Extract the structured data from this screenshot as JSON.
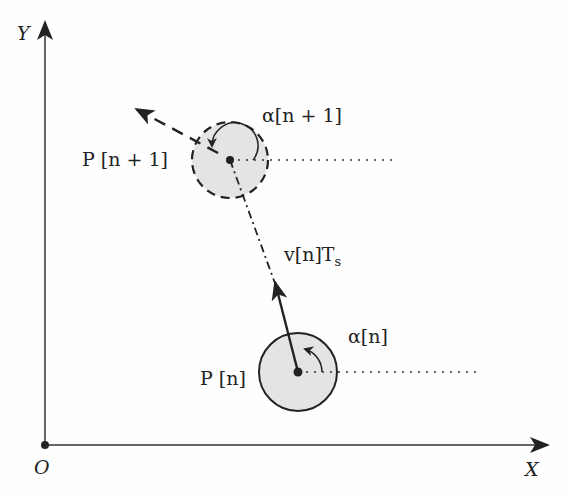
{
  "diagram": {
    "type": "kinematic-motion-model",
    "axes": {
      "x_label": "X",
      "y_label": "Y",
      "origin_label": "O"
    },
    "positions": {
      "current": {
        "label": "P [n]",
        "angle_label": "α[n]",
        "outline": "solid"
      },
      "next": {
        "label": "P [n + 1]",
        "angle_label": "α[n + 1]",
        "outline": "dashed"
      }
    },
    "displacement_label": "v[n]T",
    "displacement_subscript": "s",
    "colors": {
      "stroke": "#222222",
      "fill": "#e4e4e4",
      "background": "#fefefe"
    }
  }
}
